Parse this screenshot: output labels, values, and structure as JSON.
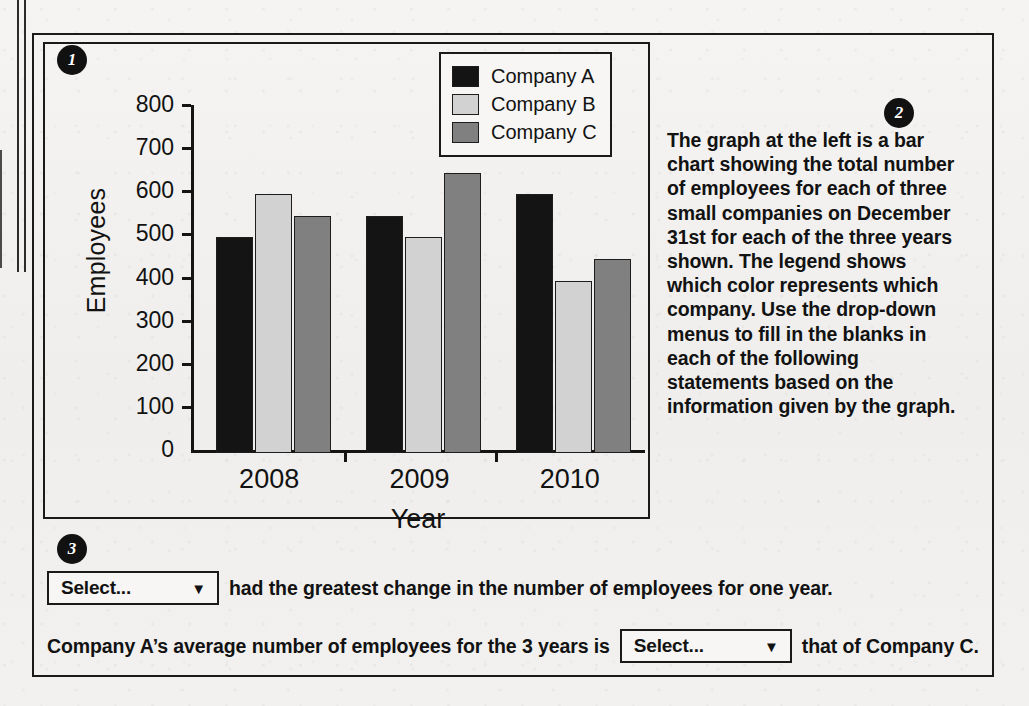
{
  "badges": {
    "one": "1",
    "two": "2",
    "three": "3"
  },
  "chart_data": {
    "type": "bar",
    "title": "",
    "xlabel": "Year",
    "ylabel": "Employees",
    "categories": [
      "2008",
      "2009",
      "2010"
    ],
    "series": [
      {
        "name": "Company A",
        "color": "#141414",
        "values": [
          500,
          550,
          600
        ]
      },
      {
        "name": "Company B",
        "color": "#d2d2d2",
        "values": [
          600,
          500,
          400
        ]
      },
      {
        "name": "Company C",
        "color": "#808080",
        "values": [
          550,
          650,
          450
        ]
      }
    ],
    "ylim": [
      0,
      800
    ],
    "ytick_labels": [
      "800",
      "700",
      "600",
      "500",
      "400",
      "300",
      "200",
      "100",
      "0"
    ],
    "yticks": [
      800,
      700,
      600,
      500,
      400,
      300,
      200,
      100,
      0
    ],
    "grid": false,
    "legend_position": "top-right"
  },
  "legend": {
    "entries": [
      {
        "label": "Company A",
        "color": "#141414"
      },
      {
        "label": "Company B",
        "color": "#d2d2d2"
      },
      {
        "label": "Company C",
        "color": "#808080"
      }
    ]
  },
  "description": {
    "text": "The graph at the left is a bar chart showing the total number of employees for each of three small companies on December 31st for each of the three years shown. The legend shows which color represents which company. Use the drop-down menus to fill in the blanks in each of the following statements based on the information given by the graph."
  },
  "statements": {
    "first": {
      "dropdown_value": "Select...",
      "caret": "▼",
      "text_after": "had the greatest change in the number of employees for one year."
    },
    "second": {
      "text_before": "Company A’s average number of employees for the 3 years is",
      "dropdown_value": "Select...",
      "caret": "▼",
      "text_after": "that of Company C."
    }
  }
}
